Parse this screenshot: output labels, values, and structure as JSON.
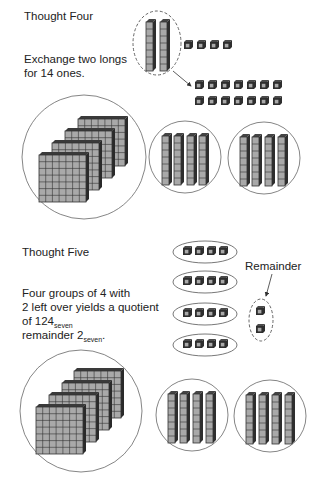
{
  "thought_four": {
    "heading": "Thought Four",
    "line1": "Exchange two longs",
    "line2": "for 14 ones.",
    "longs_exchanged": 2,
    "ones_loose": 4,
    "ones_from_exchange": 14,
    "flats": 4,
    "long_groups": [
      4,
      4
    ]
  },
  "thought_five": {
    "heading": "Thought Five",
    "line1": "Four groups of 4 with",
    "line2": "2 left over yields a quotient",
    "line3_pre": "of 124",
    "line3_sub": "seven",
    "line4_pre": "remainder 2",
    "line4_sub": "seven",
    "line4_post": ".",
    "remainder_label": "Remainder",
    "groups_of_ones": [
      4,
      4,
      4,
      4
    ],
    "remainder_ones": 2,
    "flats": 4,
    "long_groups": [
      4,
      4
    ]
  },
  "colors": {
    "block_face": "#a9a9a9",
    "block_dark": "#2e2e2e",
    "block_top": "#4a4a4a",
    "outline": "#555555",
    "grid": "#333333"
  }
}
